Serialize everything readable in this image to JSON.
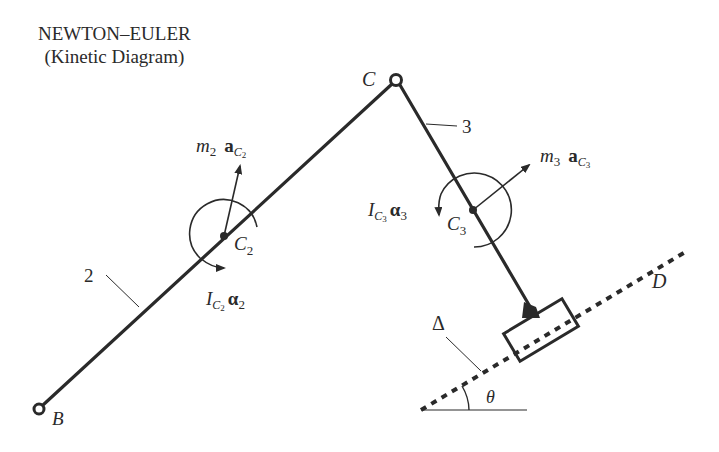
{
  "title": {
    "line1": "NEWTON–EULER",
    "line2": "(Kinetic Diagram)"
  },
  "points": {
    "B": {
      "label": "B",
      "x": 39,
      "y": 409
    },
    "C": {
      "label": "C",
      "x": 396,
      "y": 80
    },
    "C2": {
      "label": "C",
      "sub": "2",
      "x": 224,
      "y": 236
    },
    "C3": {
      "label": "C",
      "sub": "3",
      "x": 473,
      "y": 210
    },
    "D": {
      "label": "D"
    }
  },
  "links": {
    "link2": {
      "label": "2"
    },
    "link3": {
      "label": "3"
    }
  },
  "vectors": {
    "inertial_force_2": {
      "m": "m",
      "m_sub": "2",
      "a": "a",
      "a_sub": "C",
      "a_subsub": "2"
    },
    "inertial_moment_2": {
      "I": "I",
      "I_sub": "C",
      "I_subsub": "2",
      "alpha": "α",
      "alpha_sub": "2"
    },
    "inertial_force_3": {
      "m": "m",
      "m_sub": "3",
      "a": "a",
      "a_sub": "C",
      "a_subsub": "3"
    },
    "inertial_moment_3": {
      "I": "I",
      "I_sub": "C",
      "I_subsub": "3",
      "alpha": "α",
      "alpha_sub": "3"
    }
  },
  "guide": {
    "delta_label": "Δ",
    "angle_label": "θ"
  },
  "colors": {
    "ink": "#2a2a2a",
    "background": "#ffffff"
  }
}
